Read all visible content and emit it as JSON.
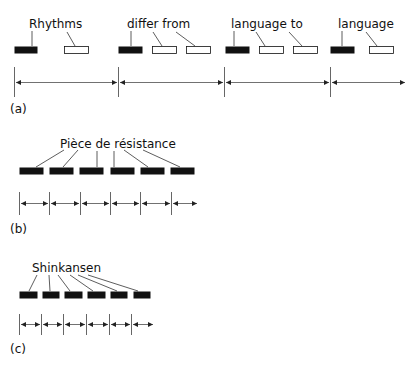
{
  "panels": [
    {
      "id": "a",
      "caption": "(a)",
      "words": [
        {
          "label": "Rhythms",
          "x": 29,
          "y": 28
        },
        {
          "label": "differ from",
          "x": 127,
          "y": 28
        },
        {
          "label": "language to",
          "x": 231,
          "y": 28
        },
        {
          "label": "language",
          "x": 338,
          "y": 28
        }
      ],
      "syllables": [
        {
          "x": 14,
          "w": 23,
          "filled": true
        },
        {
          "x": 64,
          "w": 24,
          "filled": false
        },
        {
          "x": 118,
          "w": 24,
          "filled": true
        },
        {
          "x": 152,
          "w": 24,
          "filled": false
        },
        {
          "x": 186,
          "w": 24,
          "filled": false
        },
        {
          "x": 225,
          "w": 24,
          "filled": true
        },
        {
          "x": 259,
          "w": 24,
          "filled": false
        },
        {
          "x": 293,
          "w": 24,
          "filled": false
        },
        {
          "x": 330,
          "w": 24,
          "filled": true
        },
        {
          "x": 369,
          "w": 24,
          "filled": false
        }
      ],
      "beats": [
        14,
        118,
        224,
        330
      ],
      "end_x": 405
    },
    {
      "id": "b",
      "caption": "(b)",
      "words": [
        {
          "label": "Pièce de résistance",
          "x": 60,
          "y": 151
        }
      ],
      "syllables": [
        {
          "x": 19,
          "w": 24,
          "filled": true
        },
        {
          "x": 49,
          "w": 24,
          "filled": true
        },
        {
          "x": 79,
          "w": 24,
          "filled": true
        },
        {
          "x": 110,
          "w": 24,
          "filled": true
        },
        {
          "x": 140,
          "w": 24,
          "filled": true
        },
        {
          "x": 170,
          "w": 24,
          "filled": true
        }
      ],
      "beats": [
        19,
        49,
        80,
        110,
        140,
        171
      ],
      "end_x": 197
    },
    {
      "id": "c",
      "caption": "(c)",
      "words": [
        {
          "label": "Shinkansen",
          "x": 32,
          "y": 273
        }
      ],
      "syllables": [
        {
          "x": 19,
          "w": 18,
          "filled": true
        },
        {
          "x": 42,
          "w": 17,
          "filled": true
        },
        {
          "x": 64,
          "w": 18,
          "filled": true
        },
        {
          "x": 87,
          "w": 18,
          "filled": true
        },
        {
          "x": 110,
          "w": 17,
          "filled": true
        },
        {
          "x": 133,
          "w": 17,
          "filled": true
        }
      ],
      "beats": [
        19,
        41,
        63,
        86,
        109,
        131
      ],
      "end_x": 153
    }
  ],
  "colors": {
    "ink": "#111111",
    "line": "#555555",
    "paper": "#ffffff"
  }
}
